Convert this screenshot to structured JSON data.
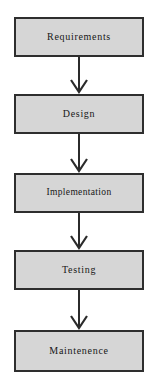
{
  "diagram": {
    "type": "flowchart-vertical",
    "colors": {
      "box_fill": "#d6d6d6",
      "box_border": "#2e2e2e",
      "arrow": "#2b2b2b",
      "text": "#161616",
      "background": "#ffffff"
    },
    "stages": [
      {
        "id": "requirements",
        "label": "Requirements"
      },
      {
        "id": "design",
        "label": "Design"
      },
      {
        "id": "implementation",
        "label": "Implementation"
      },
      {
        "id": "testing",
        "label": "Testing"
      },
      {
        "id": "maintenence",
        "label": "Maintenence"
      }
    ],
    "connectors": [
      {
        "id": "arrow-requirements-design",
        "from": "requirements",
        "to": "design",
        "style": "open-v-arrow",
        "direction": "down"
      },
      {
        "id": "arrow-design-implementation",
        "from": "design",
        "to": "implementation",
        "style": "open-v-arrow",
        "direction": "down"
      },
      {
        "id": "arrow-implementation-testing",
        "from": "implementation",
        "to": "testing",
        "style": "open-v-arrow",
        "direction": "down"
      },
      {
        "id": "arrow-testing-maintenence",
        "from": "testing",
        "to": "maintenence",
        "style": "open-v-arrow",
        "direction": "down"
      }
    ]
  }
}
